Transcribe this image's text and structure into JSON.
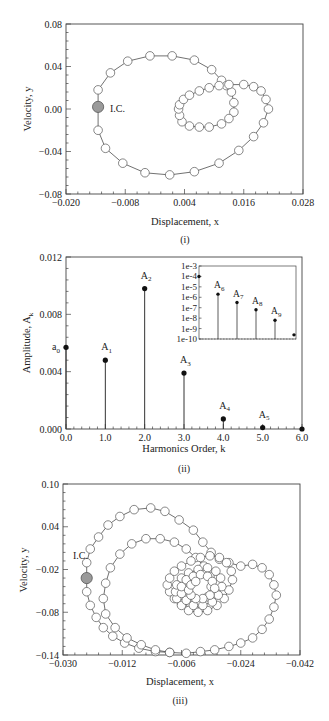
{
  "chart_data": [
    {
      "id": "panel-i",
      "type": "scatter",
      "caption": "(i)",
      "xlabel": "Displacement, x",
      "ylabel": "Velocity, y",
      "xlim": [
        -0.02,
        0.028
      ],
      "ylim": [
        -0.08,
        0.08
      ],
      "xticks": [
        "-0.020",
        "-0.008",
        "0.004",
        "0.016",
        "0.028"
      ],
      "yticks": [
        "0.08",
        "0.04",
        "0.00",
        "-0.04",
        "-0.08"
      ],
      "annotation": "I.C.",
      "initial_condition": {
        "x": -0.0135,
        "y": 0.002
      },
      "description": "Phase trajectory with open circle markers: large outer loop starting at I.C., followed by inner teardrop loop converging near x≈0.003, y≈0.0",
      "series": [
        {
          "name": "outer-loop",
          "points": [
            [
              -0.0135,
              0.002
            ],
            [
              -0.0135,
              0.018
            ],
            [
              -0.011,
              0.034
            ],
            [
              -0.0075,
              0.045
            ],
            [
              -0.003,
              0.05
            ],
            [
              0.0015,
              0.05
            ],
            [
              0.006,
              0.046
            ],
            [
              0.0095,
              0.037
            ],
            [
              0.0115,
              0.027
            ],
            [
              0.0125,
              0.022
            ],
            [
              0.0135,
              0.016
            ],
            [
              0.014,
              0.006
            ],
            [
              0.014,
              -0.003
            ],
            [
              0.013,
              -0.009
            ],
            [
              0.0115,
              -0.014
            ],
            [
              0.009,
              -0.017
            ],
            [
              0.007,
              -0.017
            ],
            [
              0.005,
              -0.016
            ],
            [
              0.0035,
              -0.012
            ],
            [
              0.003,
              -0.006
            ],
            [
              0.0028,
              0.0
            ],
            [
              0.003,
              0.004
            ],
            [
              0.0038,
              0.009
            ],
            [
              0.005,
              0.013
            ],
            [
              0.007,
              0.017
            ],
            [
              0.009,
              0.02
            ],
            [
              0.011,
              0.022
            ],
            [
              0.013,
              0.023
            ],
            [
              0.016,
              0.023
            ],
            [
              0.018,
              0.021
            ],
            [
              0.0195,
              0.017
            ],
            [
              0.0205,
              0.009
            ],
            [
              0.021,
              0.0
            ],
            [
              0.02,
              -0.013
            ],
            [
              0.018,
              -0.026
            ],
            [
              0.015,
              -0.039
            ],
            [
              0.011,
              -0.051
            ],
            [
              0.006,
              -0.059
            ],
            [
              0.001,
              -0.062
            ],
            [
              -0.004,
              -0.06
            ],
            [
              -0.0085,
              -0.051
            ],
            [
              -0.012,
              -0.037
            ],
            [
              -0.0135,
              -0.02
            ],
            [
              -0.0135,
              0.002
            ]
          ]
        }
      ]
    },
    {
      "id": "panel-ii",
      "type": "bar",
      "subtype": "stem",
      "caption": "(ii)",
      "xlabel": "Harmonics Order, k",
      "ylabel": "Amplitude, A_k",
      "xlim": [
        0.0,
        6.0
      ],
      "ylim": [
        0.0,
        0.012
      ],
      "xticks": [
        "0.0",
        "1.0",
        "2.0",
        "3.0",
        "4.0",
        "5.0",
        "6.0"
      ],
      "yticks": [
        "0.012",
        "0.008",
        "0.004",
        "0.000"
      ],
      "categories": [
        "a0",
        "A1",
        "A2",
        "A3",
        "A4",
        "A5",
        "A6"
      ],
      "x": [
        0,
        1,
        2,
        3,
        4,
        5,
        6
      ],
      "values": [
        0.0057,
        0.0048,
        0.0098,
        0.0039,
        0.0007,
        0.0001,
        0.0
      ],
      "labels": [
        {
          "text": "a",
          "sub": "0",
          "k": 0
        },
        {
          "text": "A",
          "sub": "1",
          "k": 1
        },
        {
          "text": "A",
          "sub": "2",
          "k": 2
        },
        {
          "text": "A",
          "sub": "3",
          "k": 3
        },
        {
          "text": "A",
          "sub": "4",
          "k": 4
        },
        {
          "text": "A",
          "sub": "5",
          "k": 5
        }
      ],
      "inset": {
        "type": "bar",
        "subtype": "stem",
        "yscale": "log",
        "yticks": [
          "1e-3",
          "1e-4",
          "1e-5",
          "1e-6",
          "1e-7",
          "1e-8",
          "1e-9",
          "1e-10"
        ],
        "ylim_exp": [
          -10,
          -3
        ],
        "x": [
          5,
          6,
          7,
          8,
          9,
          10
        ],
        "categories": [
          "A5",
          "A6",
          "A7",
          "A8",
          "A9",
          "A10"
        ],
        "log10_values": [
          -4.0,
          -5.7,
          -6.5,
          -7.2,
          -8.2,
          -9.6
        ],
        "labels": [
          {
            "text": "A",
            "sub": "6"
          },
          {
            "text": "A",
            "sub": "7"
          },
          {
            "text": "A",
            "sub": "8"
          },
          {
            "text": "A",
            "sub": "9"
          }
        ]
      }
    },
    {
      "id": "panel-iii",
      "type": "scatter",
      "caption": "(iii)",
      "xlabel": "Displacement, x",
      "ylabel": "Velocity, y",
      "xticks": [
        "-0.030",
        "-0.012",
        "-0.006",
        "-0.024",
        "-0.042"
      ],
      "yticks": [
        "0.10",
        "0.04",
        "-0.02",
        "-0.08",
        "-0.14"
      ],
      "annotation": "I.C.",
      "description": "Phase trajectory with open circle markers: large outer loop from I.C., a second intermediate loop, then a nested inner loop cluster near the center-right; tick labels reproduced as printed",
      "note": "Coordinates below are in normalized plot units (0-1 across x, 0-1 from bottom to top in y)",
      "series": [
        {
          "name": "trajectory-normalized",
          "points": [
            [
              0.1,
              0.45
            ],
            [
              0.1,
              0.54
            ],
            [
              0.115,
              0.62
            ],
            [
              0.15,
              0.69
            ],
            [
              0.19,
              0.76
            ],
            [
              0.24,
              0.81
            ],
            [
              0.3,
              0.85
            ],
            [
              0.37,
              0.86
            ],
            [
              0.43,
              0.84
            ],
            [
              0.49,
              0.79
            ],
            [
              0.55,
              0.73
            ],
            [
              0.59,
              0.66
            ],
            [
              0.625,
              0.6
            ],
            [
              0.66,
              0.56
            ],
            [
              0.7,
              0.54
            ],
            [
              0.75,
              0.52
            ],
            [
              0.8,
              0.53
            ],
            [
              0.84,
              0.51
            ],
            [
              0.87,
              0.47
            ],
            [
              0.89,
              0.41
            ],
            [
              0.9,
              0.35
            ],
            [
              0.89,
              0.28
            ],
            [
              0.87,
              0.21
            ],
            [
              0.84,
              0.15
            ],
            [
              0.8,
              0.1
            ],
            [
              0.75,
              0.07
            ],
            [
              0.7,
              0.05
            ],
            [
              0.64,
              0.03
            ],
            [
              0.58,
              0.02
            ],
            [
              0.52,
              0.01
            ],
            [
              0.45,
              0.015
            ],
            [
              0.39,
              0.03
            ],
            [
              0.33,
              0.06
            ],
            [
              0.27,
              0.1
            ],
            [
              0.22,
              0.16
            ],
            [
              0.18,
              0.24
            ],
            [
              0.17,
              0.33
            ],
            [
              0.18,
              0.42
            ],
            [
              0.2,
              0.51
            ],
            [
              0.24,
              0.59
            ],
            [
              0.29,
              0.65
            ],
            [
              0.35,
              0.68
            ],
            [
              0.41,
              0.68
            ],
            [
              0.47,
              0.66
            ],
            [
              0.52,
              0.62
            ],
            [
              0.56,
              0.57
            ],
            [
              0.595,
              0.52
            ],
            [
              0.62,
              0.46
            ],
            [
              0.625,
              0.4
            ],
            [
              0.61,
              0.34
            ],
            [
              0.58,
              0.3
            ],
            [
              0.54,
              0.29
            ],
            [
              0.5,
              0.3
            ],
            [
              0.47,
              0.33
            ],
            [
              0.45,
              0.37
            ],
            [
              0.44,
              0.41
            ],
            [
              0.45,
              0.45
            ],
            [
              0.47,
              0.49
            ],
            [
              0.5,
              0.52
            ],
            [
              0.54,
              0.55
            ],
            [
              0.58,
              0.57
            ],
            [
              0.62,
              0.58
            ],
            [
              0.66,
              0.57
            ],
            [
              0.69,
              0.54
            ],
            [
              0.71,
              0.49
            ],
            [
              0.715,
              0.44
            ],
            [
              0.7,
              0.38
            ],
            [
              0.68,
              0.33
            ],
            [
              0.65,
              0.29
            ],
            [
              0.61,
              0.26
            ],
            [
              0.57,
              0.25
            ],
            [
              0.53,
              0.26
            ],
            [
              0.5,
              0.29
            ],
            [
              0.48,
              0.33
            ],
            [
              0.475,
              0.37
            ],
            [
              0.48,
              0.41
            ],
            [
              0.5,
              0.45
            ],
            [
              0.53,
              0.48
            ],
            [
              0.57,
              0.5
            ],
            [
              0.61,
              0.51
            ],
            [
              0.645,
              0.49
            ],
            [
              0.665,
              0.45
            ],
            [
              0.67,
              0.4
            ],
            [
              0.655,
              0.35
            ],
            [
              0.63,
              0.31
            ],
            [
              0.59,
              0.29
            ],
            [
              0.55,
              0.29
            ],
            [
              0.52,
              0.32
            ],
            [
              0.5,
              0.36
            ],
            [
              0.5,
              0.4
            ],
            [
              0.52,
              0.44
            ],
            [
              0.55,
              0.46
            ],
            [
              0.58,
              0.47
            ],
            [
              0.61,
              0.46
            ],
            [
              0.63,
              0.43
            ],
            [
              0.64,
              0.39
            ],
            [
              0.62,
              0.35
            ],
            [
              0.59,
              0.33
            ],
            [
              0.56,
              0.33
            ],
            [
              0.54,
              0.35
            ],
            [
              0.53,
              0.38
            ],
            [
              0.54,
              0.41
            ],
            [
              0.56,
              0.43
            ]
          ],
          "ic_index": 0,
          "outer_close": [
            [
              0.1,
              0.45
            ],
            [
              0.1,
              0.37
            ],
            [
              0.115,
              0.29
            ],
            [
              0.14,
              0.22
            ],
            [
              0.17,
              0.16
            ],
            [
              0.21,
              0.11
            ],
            [
              0.26,
              0.07
            ],
            [
              0.32,
              0.04
            ],
            [
              0.39,
              0.02
            ],
            [
              0.45,
              0.015
            ]
          ]
        }
      ]
    }
  ],
  "figure": {
    "panels": 3,
    "captions": [
      "(i)",
      "(ii)",
      "(iii)"
    ]
  }
}
